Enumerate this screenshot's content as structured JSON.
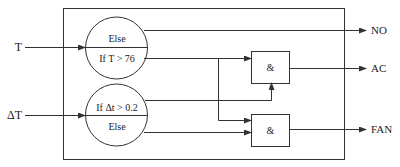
{
  "diagram": {
    "type": "logic-block-diagram",
    "inputs": [
      {
        "id": "T",
        "label": "T"
      },
      {
        "id": "dT",
        "label": "ΔT"
      }
    ],
    "comparators": [
      {
        "id": "cmp-T",
        "top_label": "Else",
        "bottom_label": "If T > 76"
      },
      {
        "id": "cmp-dT",
        "top_label": "If Δt > 0.2",
        "bottom_label": "Else"
      }
    ],
    "gates": [
      {
        "id": "and-ac",
        "label": "&"
      },
      {
        "id": "and-fan",
        "label": "&"
      }
    ],
    "outputs": [
      {
        "id": "NO",
        "label": "NO"
      },
      {
        "id": "AC",
        "label": "AC"
      },
      {
        "id": "FAN",
        "label": "FAN"
      }
    ],
    "connections": [
      {
        "from": "T",
        "to": "cmp-T"
      },
      {
        "from": "dT",
        "to": "cmp-dT"
      },
      {
        "from": "cmp-T.else",
        "to": "NO"
      },
      {
        "from": "cmp-T.if",
        "to": "and-ac"
      },
      {
        "from": "cmp-T.if",
        "to": "and-fan"
      },
      {
        "from": "cmp-dT.if",
        "to": "and-ac"
      },
      {
        "from": "cmp-dT.else",
        "to": "and-fan"
      },
      {
        "from": "and-ac",
        "to": "AC"
      },
      {
        "from": "and-fan",
        "to": "FAN"
      }
    ],
    "colors": {
      "stroke": "#333333",
      "text": "#222222",
      "background": "#ffffff"
    }
  }
}
